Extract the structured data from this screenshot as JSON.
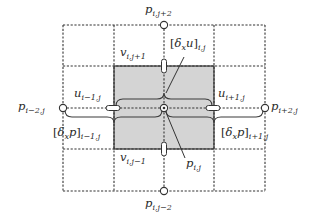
{
  "diagram": {
    "type": "staggered finite-difference grid stencil",
    "colors": {
      "grid_line": "#333333",
      "shaded_cell": "#d4d4d4",
      "brace": "#3a3a3a",
      "text": "#2a2a2a",
      "node_fill": "#ffffff"
    },
    "grid": {
      "x_lines": [
        63,
        114,
        164,
        214,
        265
      ],
      "y_lines": [
        25,
        66,
        108,
        149,
        191
      ],
      "line_style": "dashed"
    },
    "shaded_region": {
      "x": 114,
      "y": 66,
      "w": 100,
      "h": 83
    },
    "pressure_nodes": [
      {
        "id": "p_i_jp2",
        "base": "p",
        "sub": "i,j+2",
        "x": 164,
        "y": 25
      },
      {
        "id": "p_i_jm2",
        "base": "p",
        "sub": "i,j−2",
        "x": 164,
        "y": 191
      },
      {
        "id": "p_im2_j",
        "base": "p",
        "sub": "i−2,j",
        "x": 63,
        "y": 108
      },
      {
        "id": "p_ip2_j",
        "base": "p",
        "sub": "i+2,j",
        "x": 265,
        "y": 108
      },
      {
        "id": "p_i_j",
        "base": "p",
        "sub": "i,j",
        "x": 164,
        "y": 108
      }
    ],
    "velocity_arrows": [
      {
        "id": "u_im1_j",
        "base": "u",
        "sub": "i−1,j",
        "x": 114,
        "y": 108,
        "orientation": "horizontal"
      },
      {
        "id": "u_ip1_j",
        "base": "u",
        "sub": "i+1,j",
        "x": 214,
        "y": 108,
        "orientation": "horizontal"
      },
      {
        "id": "v_i_jp1",
        "base": "v",
        "sub": "i,j+1",
        "x": 164,
        "y": 66,
        "orientation": "vertical"
      },
      {
        "id": "v_i_jm1",
        "base": "v",
        "sub": "i,j−1",
        "x": 164,
        "y": 149,
        "orientation": "vertical"
      }
    ],
    "labels": {
      "p_i_jp2": {
        "base": "p",
        "sub": "i,j+2"
      },
      "p_i_jm2": {
        "base": "p",
        "sub": "i,j−2"
      },
      "p_im2_j": {
        "base": "p",
        "sub": "i−2,j"
      },
      "p_ip2_j": {
        "base": "p",
        "sub": "i+2,j"
      },
      "p_i_j": {
        "base": "p",
        "sub": "i,j"
      },
      "u_im1_j": {
        "base": "u",
        "sub": "i−1,j"
      },
      "u_ip1_j": {
        "base": "u",
        "sub": "i+1,j"
      },
      "v_i_jp1": {
        "base": "v",
        "sub": "i,j+1"
      },
      "v_i_jm1": {
        "base": "v",
        "sub": "i,j−1"
      },
      "dxu_i_j": {
        "open": "[",
        "op": "δ",
        "op_sub": "x",
        "var": "u",
        "close": "]",
        "sub": "i,j"
      },
      "dxp_im1_j": {
        "open": "[",
        "op": "δ",
        "op_sub": "x",
        "var": "p",
        "close": "]",
        "sub": "i−1,j"
      },
      "dxp_ip1_j": {
        "open": "[",
        "op": "δ",
        "op_sub": "x",
        "var": "p",
        "close": "]",
        "sub": "i+1,j"
      }
    },
    "braces": [
      {
        "id": "brace-dxu",
        "from_x": 114,
        "to_x": 214,
        "y": 99,
        "direction": "up",
        "label": "dxu_i_j"
      },
      {
        "id": "brace-dxp-left",
        "from_x": 63,
        "to_x": 164,
        "y": 117,
        "direction": "down",
        "label": "dxp_im1_j"
      },
      {
        "id": "brace-dxp-right",
        "from_x": 164,
        "to_x": 265,
        "y": 117,
        "direction": "down",
        "label": "dxp_ip1_j"
      }
    ]
  }
}
